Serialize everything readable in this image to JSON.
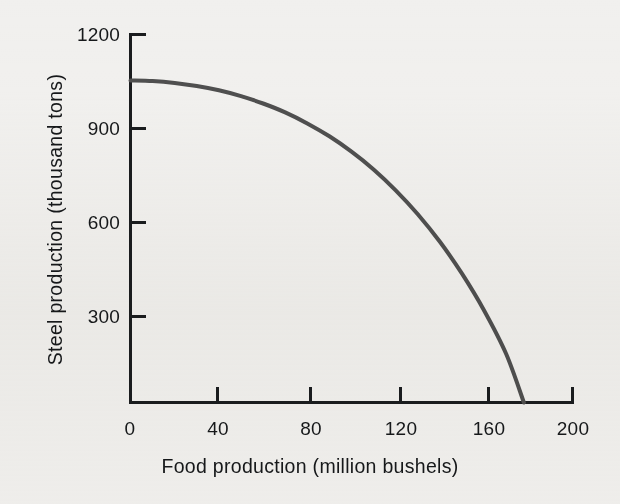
{
  "chart_data": {
    "type": "line",
    "title": "",
    "subtitle": "",
    "xlabel": "Food production (million bushels)",
    "ylabel": "Steel production (thousand tons)",
    "xlim": [
      0,
      200
    ],
    "ylim": [
      0,
      1200
    ],
    "xticks": [
      0,
      40,
      80,
      120,
      160,
      200
    ],
    "xtick_labels": [
      "0",
      "40",
      "80",
      "120",
      "160",
      "200"
    ],
    "yticks": [
      300,
      600,
      900,
      1200
    ],
    "ytick_labels": [
      "300",
      "600",
      "900",
      "1200"
    ],
    "grid": false,
    "legend": null,
    "annotations": [],
    "series": [
      {
        "name": "Production possibilities frontier",
        "color": "#4f4f4f",
        "line_width": 4,
        "x": [
          0,
          10,
          20,
          30,
          40,
          50,
          60,
          70,
          80,
          90,
          100,
          110,
          120,
          130,
          140,
          150,
          160,
          170,
          178
        ],
        "y": [
          1050,
          1048,
          1042,
          1032,
          1018,
          999,
          975,
          946,
          910,
          868,
          818,
          760,
          692,
          614,
          524,
          420,
          300,
          158,
          0
        ]
      }
    ]
  },
  "axes": {
    "tick_color": "#16181a",
    "axis_color": "#1a1c1e",
    "background": "#f1f0ee"
  },
  "ticks": {
    "y": [
      {
        "label": "1200",
        "value": 1200
      },
      {
        "label": "900",
        "value": 900
      },
      {
        "label": "600",
        "value": 600
      },
      {
        "label": "300",
        "value": 300
      }
    ],
    "x": [
      {
        "label": "0",
        "value": 0
      },
      {
        "label": "40",
        "value": 40
      },
      {
        "label": "80",
        "value": 80
      },
      {
        "label": "120",
        "value": 120
      },
      {
        "label": "160",
        "value": 160
      },
      {
        "label": "200",
        "value": 200
      }
    ]
  }
}
